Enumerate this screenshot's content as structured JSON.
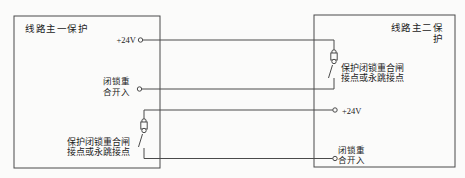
{
  "diagram": {
    "background": "#fbfbfa",
    "line_color": "#4a4a4a",
    "text_color": "#222222",
    "main1": {
      "title": "线路主一保护",
      "supply_label": "+24V",
      "reclose_input_label": "闭锁重\n合开入",
      "contact_label": "保护闭锁重合闸\n接点或永跳接点"
    },
    "main2": {
      "title": "线路主二保护",
      "supply_label": "+24V",
      "reclose_input_label": "闭锁重\n合开入",
      "contact_label": "保护闭锁重合闸\n接点或永跳接点"
    }
  }
}
